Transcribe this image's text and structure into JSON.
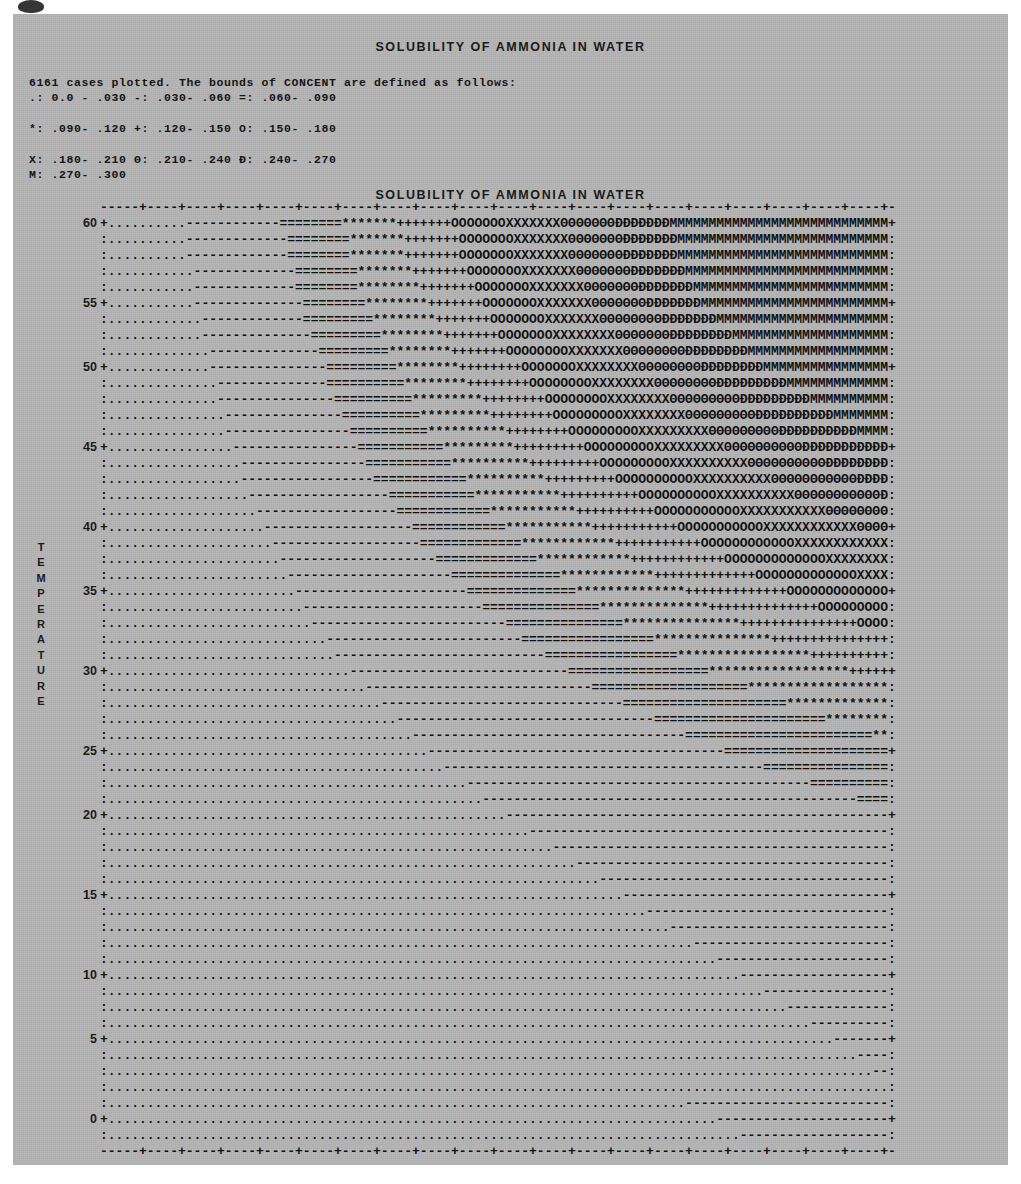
{
  "page": {
    "background_color": "#b5b5b5",
    "ink_color": "#141414",
    "smudge_icon": "ink-smudge"
  },
  "title_top": "SOLUBILITY OF AMMONIA IN WATER",
  "title_plot": "SOLUBILITY OF AMMONIA IN WATER",
  "legend": {
    "header": "6161 cases plotted. The bounds of CONCENT are defined as follows:",
    "lines": [
      " .:    0.0  -    .030  -:    .030-    .060  =:    .060-    .090",
      " *:    .090-    .120  +:    .120-    .150  O:    .150-    .180",
      " X:    .180-    .210  Θ:    .210-    .240  Ð:    .240-    .270",
      " M:    .270-    .300"
    ],
    "entries": [
      {
        "symbol": ".",
        "low": "0.0",
        "high": ".030"
      },
      {
        "symbol": "-",
        "low": ".030",
        "high": ".060"
      },
      {
        "symbol": "=",
        "low": ".060",
        "high": ".090"
      },
      {
        "symbol": "*",
        "low": ".090",
        "high": ".120"
      },
      {
        "symbol": "+",
        "low": ".120",
        "high": ".150"
      },
      {
        "symbol": "O",
        "low": ".150",
        "high": ".180"
      },
      {
        "symbol": "X",
        "low": ".180",
        "high": ".210"
      },
      {
        "symbol": "Θ",
        "low": ".210",
        "high": ".240"
      },
      {
        "symbol": "Ð",
        "low": ".240",
        "high": ".270"
      },
      {
        "symbol": "M",
        "low": ".270",
        "high": ".300"
      }
    ],
    "cases_plotted": 6161,
    "variable": "CONCENT"
  },
  "chart_data": {
    "type": "heatmap",
    "title": "SOLUBILITY OF AMMONIA IN WATER",
    "xlabel": "ATMOSPHERIC PRESSURE",
    "ylabel": "TEMPERATURE",
    "xlim": [
      0,
      1000
    ],
    "ylim": [
      0,
      62
    ],
    "xticks": [
      50,
      150,
      250,
      350,
      450,
      550,
      650,
      750,
      850,
      950
    ],
    "yticks": [
      0,
      5,
      10,
      15,
      20,
      25,
      30,
      35,
      40,
      45,
      50,
      55,
      60
    ],
    "grid": false,
    "legend_position": "above-plot",
    "zvariable": "CONCENT",
    "zlim": [
      0.0,
      0.3
    ],
    "band_width": 0.03,
    "symbols": [
      ".",
      "-",
      "=",
      "*",
      "+",
      "O",
      "X",
      "Θ",
      "Ð",
      "M"
    ],
    "cases_plotted": 6161,
    "n_cols": 100,
    "n_rows": 58,
    "row_top_temperature": 61,
    "row_step_temperature": -1.0724,
    "col_left_pressure": 10,
    "col_step_pressure": 10,
    "contour_boundaries_cols": [
      [
        10,
        22,
        30,
        37,
        44,
        51,
        58,
        65,
        72,
        79
      ],
      [
        10,
        23,
        31,
        38,
        45,
        52,
        59,
        66,
        73,
        80
      ],
      [
        10,
        23,
        31,
        38,
        45,
        52,
        59,
        66,
        73,
        81
      ],
      [
        11,
        24,
        32,
        39,
        46,
        53,
        60,
        67,
        74,
        82
      ],
      [
        11,
        24,
        32,
        40,
        47,
        54,
        61,
        68,
        75,
        83
      ],
      [
        11,
        25,
        33,
        41,
        48,
        55,
        62,
        69,
        76,
        85
      ],
      [
        12,
        25,
        34,
        42,
        49,
        56,
        63,
        71,
        78,
        87
      ],
      [
        12,
        26,
        35,
        43,
        50,
        57,
        65,
        72,
        80,
        89
      ],
      [
        13,
        27,
        36,
        44,
        51,
        59,
        66,
        74,
        82,
        91
      ],
      [
        13,
        28,
        37,
        45,
        53,
        60,
        68,
        76,
        84,
        94
      ],
      [
        14,
        28,
        38,
        46,
        54,
        62,
        70,
        78,
        87,
        97
      ],
      [
        14,
        29,
        39,
        48,
        56,
        64,
        72,
        81,
        90,
        100
      ],
      [
        15,
        30,
        40,
        49,
        57,
        66,
        74,
        83,
        93,
        100
      ],
      [
        15,
        31,
        41,
        51,
        59,
        68,
        77,
        86,
        96,
        100
      ],
      [
        16,
        32,
        43,
        52,
        61,
        70,
        79,
        89,
        100,
        100
      ],
      [
        17,
        33,
        44,
        54,
        63,
        72,
        82,
        92,
        100,
        100
      ],
      [
        17,
        34,
        46,
        56,
        65,
        75,
        85,
        96,
        100,
        100
      ],
      [
        18,
        36,
        47,
        58,
        68,
        78,
        88,
        99,
        100,
        100
      ],
      [
        19,
        37,
        49,
        60,
        70,
        81,
        92,
        100,
        100,
        100
      ],
      [
        20,
        39,
        51,
        62,
        73,
        84,
        96,
        100,
        100,
        100
      ],
      [
        21,
        40,
        53,
        65,
        76,
        88,
        100,
        100,
        100,
        100
      ],
      [
        22,
        42,
        55,
        67,
        79,
        92,
        100,
        100,
        100,
        100
      ],
      [
        23,
        44,
        58,
        70,
        83,
        96,
        100,
        100,
        100,
        100
      ],
      [
        24,
        46,
        60,
        74,
        87,
        100,
        100,
        100,
        100,
        100
      ],
      [
        25,
        48,
        63,
        77,
        91,
        100,
        100,
        100,
        100,
        100
      ],
      [
        26,
        51,
        66,
        81,
        96,
        100,
        100,
        100,
        100,
        100
      ],
      [
        28,
        53,
        70,
        85,
        100,
        100,
        100,
        100,
        100,
        100
      ],
      [
        29,
        56,
        73,
        90,
        100,
        100,
        100,
        100,
        100,
        100
      ],
      [
        31,
        59,
        77,
        95,
        100,
        100,
        100,
        100,
        100,
        100
      ],
      [
        33,
        62,
        82,
        100,
        100,
        100,
        100,
        100,
        100,
        100
      ],
      [
        35,
        66,
        87,
        100,
        100,
        100,
        100,
        100,
        100,
        100
      ],
      [
        37,
        70,
        92,
        100,
        100,
        100,
        100,
        100,
        100,
        100
      ],
      [
        39,
        74,
        98,
        100,
        100,
        100,
        100,
        100,
        100,
        100
      ],
      [
        41,
        79,
        100,
        100,
        100,
        100,
        100,
        100,
        100,
        100
      ],
      [
        43,
        84,
        100,
        100,
        100,
        100,
        100,
        100,
        100,
        100
      ],
      [
        46,
        90,
        100,
        100,
        100,
        100,
        100,
        100,
        100,
        100
      ],
      [
        48,
        96,
        100,
        100,
        100,
        100,
        100,
        100,
        100,
        100
      ],
      [
        51,
        100,
        100,
        100,
        100,
        100,
        100,
        100,
        100,
        100
      ],
      [
        54,
        100,
        100,
        100,
        100,
        100,
        100,
        100,
        100,
        100
      ],
      [
        57,
        100,
        100,
        100,
        100,
        100,
        100,
        100,
        100,
        100
      ],
      [
        60,
        100,
        100,
        100,
        100,
        100,
        100,
        100,
        100,
        100
      ],
      [
        63,
        100,
        100,
        100,
        100,
        100,
        100,
        100,
        100,
        100
      ],
      [
        66,
        100,
        100,
        100,
        100,
        100,
        100,
        100,
        100,
        100
      ],
      [
        69,
        100,
        100,
        100,
        100,
        100,
        100,
        100,
        100,
        100
      ],
      [
        72,
        100,
        100,
        100,
        100,
        100,
        100,
        100,
        100,
        100
      ],
      [
        75,
        100,
        100,
        100,
        100,
        100,
        100,
        100,
        100,
        100
      ],
      [
        78,
        100,
        100,
        100,
        100,
        100,
        100,
        100,
        100,
        100
      ],
      [
        81,
        100,
        100,
        100,
        100,
        100,
        100,
        100,
        100,
        100
      ],
      [
        84,
        100,
        100,
        100,
        100,
        100,
        100,
        100,
        100,
        100
      ],
      [
        87,
        100,
        100,
        100,
        100,
        100,
        100,
        100,
        100,
        100
      ],
      [
        90,
        100,
        100,
        100,
        100,
        100,
        100,
        100,
        100,
        100
      ],
      [
        93,
        100,
        100,
        100,
        100,
        100,
        100,
        100,
        100,
        100
      ],
      [
        96,
        100,
        100,
        100,
        100,
        100,
        100,
        100,
        100,
        100
      ],
      [
        98,
        100,
        100,
        100,
        100,
        100,
        100,
        100,
        100,
        100
      ],
      [
        100,
        100,
        100,
        100,
        100,
        100,
        100,
        100,
        100,
        100
      ],
      [
        74,
        100,
        100,
        100,
        100,
        100,
        100,
        100,
        100,
        100
      ],
      [
        78,
        100,
        100,
        100,
        100,
        100,
        100,
        100,
        100,
        100
      ],
      [
        81,
        100,
        100,
        100,
        100,
        100,
        100,
        100,
        100,
        100
      ]
    ],
    "ytick_rows": [
      0,
      5,
      9,
      14,
      19,
      23,
      28,
      33,
      37,
      42,
      47,
      51,
      56
    ]
  }
}
